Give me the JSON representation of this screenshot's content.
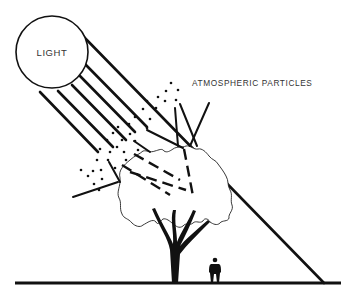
{
  "diagram": {
    "labels": {
      "light": "LIGHT",
      "particles": "ATMOSPHERIC PARTICLES"
    },
    "elements": [
      {
        "name": "light-source",
        "shape": "circle",
        "label": "LIGHT"
      },
      {
        "name": "parallel-light-rays",
        "count": 7
      },
      {
        "name": "atmospheric-particles",
        "shape": "dot-cluster"
      },
      {
        "name": "scattered-rays",
        "style": "solid"
      },
      {
        "name": "rays-through-canopy",
        "style": "dashed"
      },
      {
        "name": "tree",
        "parts": [
          "canopy",
          "trunk"
        ]
      },
      {
        "name": "person-silhouette"
      },
      {
        "name": "direct-ray-to-ground"
      },
      {
        "name": "ground-line"
      }
    ],
    "colors": {
      "ink": "#111111",
      "label": "#333333",
      "background": "#ffffff"
    }
  }
}
